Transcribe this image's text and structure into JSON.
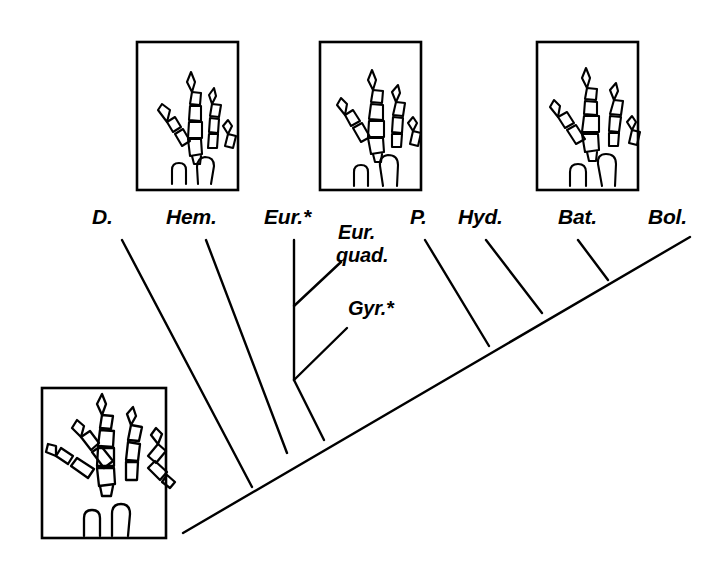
{
  "figure": {
    "type": "cladogram",
    "title": "",
    "background_color": "#ffffff",
    "line_color": "#000000",
    "width": 723,
    "height": 567
  },
  "tips": [
    {
      "id": "d",
      "label": "D.",
      "x": 100,
      "y": 228,
      "branch": {
        "x1": 122,
        "y1": 240,
        "x2": 252,
        "y2": 487
      }
    },
    {
      "id": "hem",
      "label": "Hem.",
      "x": 172,
      "y": 228,
      "branch": {
        "x1": 206,
        "y1": 240,
        "x2": 287,
        "y2": 453
      }
    },
    {
      "id": "eur",
      "label": "Eur.*",
      "x": 268,
      "y": 228,
      "branch": {
        "x1": 294,
        "y1": 240,
        "x2": 294,
        "y2": 380
      }
    },
    {
      "id": "p",
      "label": "P.",
      "x": 414,
      "y": 228,
      "branch": {
        "x1": 425,
        "y1": 240,
        "x2": 489,
        "y2": 346
      }
    },
    {
      "id": "hyd",
      "label": "Hyd.",
      "x": 462,
      "y": 228,
      "branch": {
        "x1": 486,
        "y1": 240,
        "x2": 542,
        "y2": 313
      }
    },
    {
      "id": "bat",
      "label": "Bat.",
      "x": 562,
      "y": 228,
      "branch": {
        "x1": 578,
        "y1": 240,
        "x2": 608,
        "y2": 280
      }
    },
    {
      "id": "bol",
      "label": "Bol.",
      "x": 652,
      "y": 228,
      "branch": {
        "x1": 690,
        "y1": 237,
        "x2": 183,
        "y2": 533
      }
    }
  ],
  "inner_labels": [
    {
      "id": "eur-quad",
      "line1": "Eur.",
      "line2": "quad.",
      "x": 340,
      "y": 228,
      "branch": {
        "x1": 337,
        "y1": 258,
        "x2": 294,
        "y2": 306
      }
    },
    {
      "id": "gyr",
      "line1": "Gyr.*",
      "line2": "",
      "x": 350,
      "y": 303,
      "branch": {
        "x1": 345,
        "y1": 330,
        "x2": 294,
        "y2": 380
      }
    }
  ],
  "backbone": {
    "x1": 183,
    "y1": 533,
    "x2": 690,
    "y2": 237
  },
  "nodes": [
    {
      "id": "node-eur",
      "x": 294,
      "y": 380
    },
    {
      "id": "node-base",
      "x": 252,
      "y": 487
    },
    {
      "id": "node-hem",
      "x": 287,
      "y": 453
    },
    {
      "id": "node-p",
      "x": 489,
      "y": 346
    },
    {
      "id": "node-hyd",
      "x": 542,
      "y": 313
    },
    {
      "id": "node-bat",
      "x": 608,
      "y": 280
    }
  ],
  "specimen_boxes": [
    {
      "id": "box-top-left",
      "x": 137,
      "y": 42,
      "w": 101,
      "h": 148,
      "digits": 4,
      "style": "four-digit"
    },
    {
      "id": "box-top-mid",
      "x": 320,
      "y": 42,
      "w": 101,
      "h": 148,
      "digits": 4,
      "style": "four-digit"
    },
    {
      "id": "box-top-right",
      "x": 537,
      "y": 42,
      "w": 101,
      "h": 148,
      "digits": 4,
      "style": "four-digit"
    },
    {
      "id": "box-bottom-left",
      "x": 42,
      "y": 388,
      "w": 124,
      "h": 150,
      "digits": 5,
      "style": "five-digit"
    }
  ]
}
